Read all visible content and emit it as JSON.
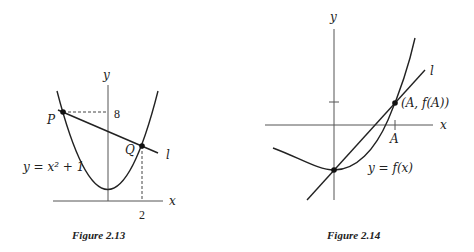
{
  "figures": [
    {
      "caption": "Figure 2.13",
      "axis_x_label": "x",
      "axis_y_label": "y",
      "curve_label": "y = x² + 1",
      "line_label": "l",
      "point_p_label": "P",
      "point_q_label": "Q",
      "tick_y_label": "8",
      "tick_x_label": "2"
    },
    {
      "caption": "Figure 2.14",
      "axis_x_label": "x",
      "axis_y_label": "y",
      "curve_label": "y = f(x)",
      "line_label": "l",
      "point_label": "(A, f(A))",
      "tick_x_label": "A"
    }
  ]
}
